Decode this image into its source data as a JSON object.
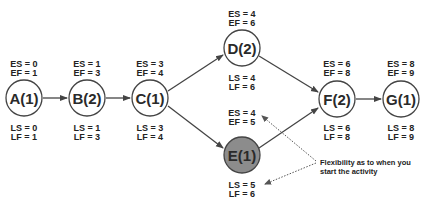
{
  "diagram": {
    "type": "activity-on-node network (critical path method)",
    "colors": {
      "stroke": "#444444",
      "node_fill": "#ffffff",
      "slack_node_fill": "#8c8c8c",
      "text": "#222222"
    },
    "nodes": [
      {
        "id": "A",
        "label": "A(1)",
        "es": "ES = 0",
        "ef": "EF = 1",
        "ls": "LS = 0",
        "lf": "LF = 1",
        "shaded": false
      },
      {
        "id": "B",
        "label": "B(2)",
        "es": "ES = 1",
        "ef": "EF = 3",
        "ls": "LS = 1",
        "lf": "LF = 3",
        "shaded": false
      },
      {
        "id": "C",
        "label": "C(1)",
        "es": "ES = 3",
        "ef": "EF = 4",
        "ls": "LS = 3",
        "lf": "LF = 4",
        "shaded": false
      },
      {
        "id": "D",
        "label": "D(2)",
        "es": "ES = 4",
        "ef": "EF = 6",
        "ls": "LS = 4",
        "lf": "LF = 6",
        "shaded": false
      },
      {
        "id": "E",
        "label": "E(1)",
        "es": "ES = 4",
        "ef": "EF = 5",
        "ls": "LS = 5",
        "lf": "LF = 6",
        "shaded": true
      },
      {
        "id": "F",
        "label": "F(2)",
        "es": "ES = 6",
        "ef": "EF = 8",
        "ls": "LS = 6",
        "lf": "LF = 8",
        "shaded": false
      },
      {
        "id": "G",
        "label": "G(1)",
        "es": "ES = 8",
        "ef": "EF = 9",
        "ls": "LS = 8",
        "lf": "LF = 9",
        "shaded": false
      }
    ],
    "edges": [
      {
        "from": "A",
        "to": "B"
      },
      {
        "from": "B",
        "to": "C"
      },
      {
        "from": "C",
        "to": "D"
      },
      {
        "from": "C",
        "to": "E"
      },
      {
        "from": "D",
        "to": "F"
      },
      {
        "from": "E",
        "to": "F"
      },
      {
        "from": "F",
        "to": "G"
      }
    ],
    "annotation": {
      "line1": "Flexibility as to when you",
      "line2": "start the activity",
      "points_to": [
        "E.es_ef",
        "E.ls_lf"
      ]
    }
  }
}
